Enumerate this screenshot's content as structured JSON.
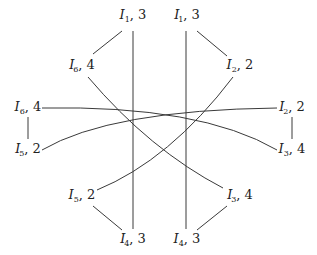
{
  "diagram": {
    "type": "graph",
    "nodes": [
      {
        "id": "I1",
        "var": "I",
        "sub": "1",
        "prime": "",
        "weight": "3",
        "x": 133,
        "y": 16
      },
      {
        "id": "I1p",
        "var": "I",
        "sub": "1",
        "prime": "′",
        "weight": "3",
        "x": 187,
        "y": 16
      },
      {
        "id": "I6p",
        "var": "I",
        "sub": "6",
        "prime": "′",
        "weight": "4",
        "x": 82,
        "y": 66
      },
      {
        "id": "I2",
        "var": "I",
        "sub": "2",
        "prime": "",
        "weight": "2",
        "x": 240,
        "y": 66
      },
      {
        "id": "I6",
        "var": "I",
        "sub": "6",
        "prime": "",
        "weight": "4",
        "x": 28,
        "y": 108
      },
      {
        "id": "I2p",
        "var": "I",
        "sub": "2",
        "prime": "′",
        "weight": "2",
        "x": 292,
        "y": 108
      },
      {
        "id": "I5p",
        "var": "I",
        "sub": "5",
        "prime": "′",
        "weight": "2",
        "x": 28,
        "y": 150
      },
      {
        "id": "I3",
        "var": "I",
        "sub": "3",
        "prime": "",
        "weight": "4",
        "x": 292,
        "y": 150
      },
      {
        "id": "I5",
        "var": "I",
        "sub": "5",
        "prime": "",
        "weight": "2",
        "x": 82,
        "y": 196
      },
      {
        "id": "I3p",
        "var": "I",
        "sub": "3",
        "prime": "′",
        "weight": "4",
        "x": 240,
        "y": 196
      },
      {
        "id": "I4p",
        "var": "I",
        "sub": "4",
        "prime": "′",
        "weight": "3",
        "x": 133,
        "y": 240
      },
      {
        "id": "I4",
        "var": "I",
        "sub": "4",
        "prime": "",
        "weight": "3",
        "x": 187,
        "y": 240
      }
    ],
    "edges": [
      {
        "from": "I1",
        "to": "I6p",
        "kind": "line"
      },
      {
        "from": "I1p",
        "to": "I2",
        "kind": "line"
      },
      {
        "from": "I6",
        "to": "I5p",
        "kind": "line"
      },
      {
        "from": "I2p",
        "to": "I3",
        "kind": "line"
      },
      {
        "from": "I5",
        "to": "I4p",
        "kind": "line"
      },
      {
        "from": "I3p",
        "to": "I4",
        "kind": "line"
      },
      {
        "from": "I1",
        "to": "I4p",
        "kind": "line"
      },
      {
        "from": "I1p",
        "to": "I4",
        "kind": "line"
      },
      {
        "from": "I6p",
        "to": "I3p",
        "kind": "curve"
      },
      {
        "from": "I2",
        "to": "I5",
        "kind": "curve"
      },
      {
        "from": "I6",
        "to": "I3",
        "kind": "curve"
      },
      {
        "from": "I5p",
        "to": "I2p",
        "kind": "curve"
      }
    ],
    "labels": {
      "I1": {
        "var": "I",
        "sub": "1",
        "prime": "",
        "sep": ", ",
        "weight": "3"
      },
      "I1p": {
        "var": "I",
        "sub": "1",
        "prime": "′",
        "sep": ", ",
        "weight": "3"
      },
      "I6p": {
        "var": "I",
        "sub": "6",
        "prime": "′",
        "sep": ", ",
        "weight": "4"
      },
      "I2": {
        "var": "I",
        "sub": "2",
        "prime": "",
        "sep": ", ",
        "weight": "2"
      },
      "I6": {
        "var": "I",
        "sub": "6",
        "prime": "",
        "sep": ", ",
        "weight": "4"
      },
      "I2p": {
        "var": "I",
        "sub": "2",
        "prime": "′",
        "sep": ", ",
        "weight": "2"
      },
      "I5p": {
        "var": "I",
        "sub": "5",
        "prime": "′",
        "sep": ", ",
        "weight": "2"
      },
      "I3": {
        "var": "I",
        "sub": "3",
        "prime": "",
        "sep": ", ",
        "weight": "4"
      },
      "I5": {
        "var": "I",
        "sub": "5",
        "prime": "",
        "sep": ", ",
        "weight": "2"
      },
      "I3p": {
        "var": "I",
        "sub": "3",
        "prime": "′",
        "sep": ", ",
        "weight": "4"
      },
      "I4p": {
        "var": "I",
        "sub": "4",
        "prime": "′",
        "sep": ", ",
        "weight": "3"
      },
      "I4": {
        "var": "I",
        "sub": "4",
        "prime": "",
        "sep": ", ",
        "weight": "3"
      }
    }
  }
}
